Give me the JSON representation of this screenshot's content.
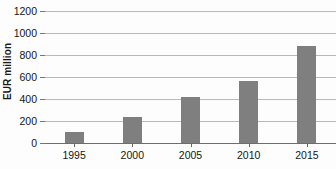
{
  "chart_data": {
    "type": "bar",
    "title": "",
    "subtitle": "",
    "xlabel": "",
    "ylabel": "EUR million",
    "categories": [
      "1995",
      "2000",
      "2005",
      "2010",
      "2015"
    ],
    "values": [
      100,
      240,
      420,
      560,
      880
    ],
    "series": [
      {
        "name": "EUR million",
        "values": [
          100,
          240,
          420,
          560,
          880
        ]
      }
    ],
    "ylim": [
      0,
      1200
    ],
    "ytick_values": [
      0,
      200,
      400,
      600,
      800,
      1000,
      1200
    ],
    "ytick_labels": [
      "0",
      "200",
      "400",
      "600",
      "800",
      "1000",
      "1200"
    ],
    "grid": true,
    "grid_axis": "y",
    "legend": false,
    "legend_position": "none",
    "annotations": [],
    "colors": {
      "bar": "#7f7f7f",
      "gridline": "#b9b9b9",
      "baseline": "#6e6e6e",
      "text": "#161616",
      "background": "#fdfdfd"
    }
  }
}
